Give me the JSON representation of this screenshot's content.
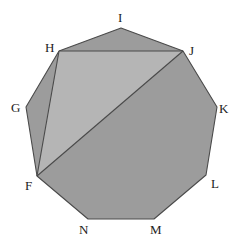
{
  "diagram": {
    "type": "polygon",
    "colors": {
      "polygon_fill": "#9c9c9c",
      "triangle_fill": "#b5b5b5",
      "stroke": "#4a4a4a",
      "label": "#222222"
    },
    "vertices": [
      {
        "name": "I",
        "x": 121,
        "y": 28,
        "label_x": 118,
        "label_y": 22
      },
      {
        "name": "J",
        "x": 183,
        "y": 51,
        "label_x": 189,
        "label_y": 55
      },
      {
        "name": "K",
        "x": 217,
        "y": 107,
        "label_x": 219,
        "label_y": 113
      },
      {
        "name": "L",
        "x": 206,
        "y": 175,
        "label_x": 211,
        "label_y": 188
      },
      {
        "name": "M",
        "x": 154,
        "y": 219,
        "label_x": 150,
        "label_y": 234
      },
      {
        "name": "N",
        "x": 88,
        "y": 219,
        "label_x": 79,
        "label_y": 234
      },
      {
        "name": "F",
        "x": 37,
        "y": 176,
        "label_x": 25,
        "label_y": 190
      },
      {
        "name": "G",
        "x": 26,
        "y": 107,
        "label_x": 11,
        "label_y": 112
      },
      {
        "name": "H",
        "x": 59,
        "y": 51,
        "label_x": 45,
        "label_y": 52
      }
    ],
    "shaded_triangle": [
      "H",
      "J",
      "F"
    ],
    "segments": [
      [
        "H",
        "J"
      ],
      [
        "J",
        "F"
      ],
      [
        "H",
        "F"
      ]
    ]
  }
}
